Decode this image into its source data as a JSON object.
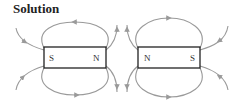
{
  "title": "Solution",
  "magnets": [
    {
      "left_pole": "S",
      "right_pole": "N"
    },
    {
      "left_pole": "N",
      "right_pole": "S"
    }
  ],
  "colors": {
    "field_line": "#9a9a9a",
    "magnet_border": "#222222"
  }
}
